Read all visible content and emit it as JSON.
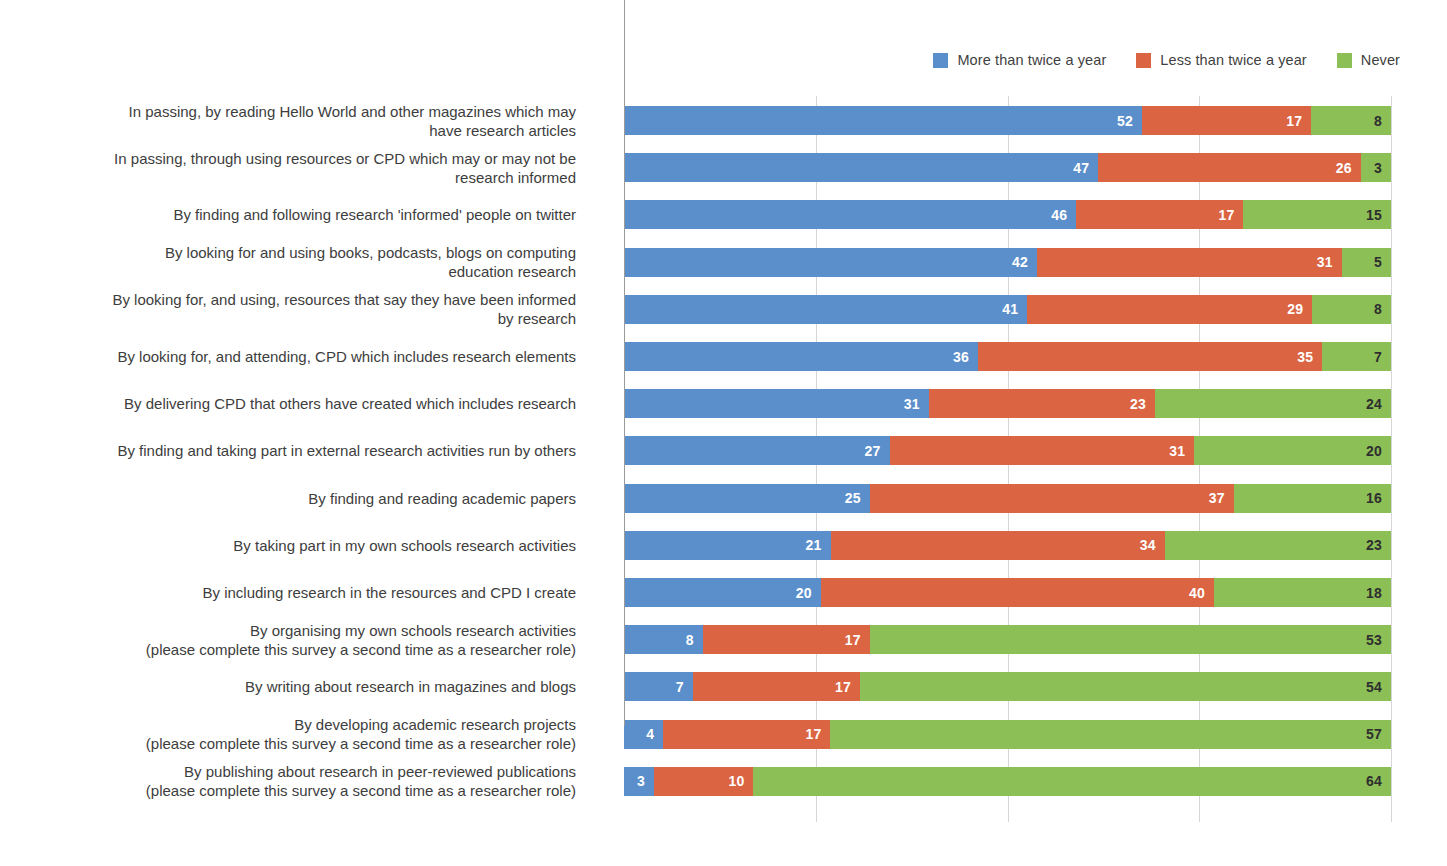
{
  "legend": {
    "position": "top-right",
    "items": [
      {
        "label": "More than twice a year",
        "color": "#5B8FCB",
        "swatch_name": "legend-swatch-more-than-twice"
      },
      {
        "label": "Less than twice a year",
        "color": "#DB6442",
        "swatch_name": "legend-swatch-less-than-twice"
      },
      {
        "label": "Never",
        "color": "#8CBF56",
        "swatch_name": "legend-swatch-never"
      }
    ]
  },
  "axis": {
    "x_tick_labels": [],
    "gridline_fractions": [
      0.25,
      0.5,
      0.75,
      1.0
    ],
    "grid": true
  },
  "chart_data": {
    "type": "bar",
    "title": "",
    "subtitle": "",
    "xlabel": "",
    "ylabel": "",
    "orientation": "horizontal",
    "stacked": true,
    "stack_mode": "100% proportional (segment widths normalised per row)",
    "grid": true,
    "legend_position": "top-right",
    "categories": [
      "In passing, by reading Hello World and other magazines which may\nhave research articles",
      "In passing, through using resources or CPD which may or may not be\nresearch informed",
      "By finding and following research 'informed' people on twitter",
      "By looking for and using books, podcasts, blogs on computing\neducation research",
      "By looking for, and using, resources that say they have been informed\nby research",
      "By looking for, and attending, CPD which includes research elements",
      "By delivering CPD that others have created which includes research",
      "By finding and taking part in external research activities run by others",
      "By finding and reading academic papers",
      "By taking part in my own schools research activities",
      "By including research in the resources and CPD I create",
      "By organising my own schools research activities\n(please complete this survey  a second time  as a researcher role)",
      "By writing about research in magazines and blogs",
      "By developing academic research projects\n(please complete this survey a second time as a researcher role)",
      "By publishing about research in peer-reviewed publications\n(please complete this survey a second time as a researcher role)"
    ],
    "series": [
      {
        "name": "More than twice a year",
        "color": "#5B8FCB",
        "values": [
          52,
          47,
          46,
          42,
          41,
          36,
          31,
          27,
          25,
          21,
          20,
          8,
          7,
          4,
          3
        ]
      },
      {
        "name": "Less than twice a year",
        "color": "#DB6442",
        "values": [
          17,
          26,
          17,
          31,
          29,
          35,
          23,
          31,
          37,
          34,
          40,
          17,
          17,
          17,
          10
        ]
      },
      {
        "name": "Never",
        "color": "#8CBF56",
        "values": [
          8,
          3,
          15,
          5,
          8,
          7,
          24,
          20,
          16,
          23,
          18,
          53,
          54,
          57,
          64
        ]
      }
    ],
    "row_totals": [
      77,
      76,
      78,
      78,
      78,
      78,
      78,
      78,
      78,
      78,
      78,
      78,
      78,
      78,
      77
    ]
  }
}
